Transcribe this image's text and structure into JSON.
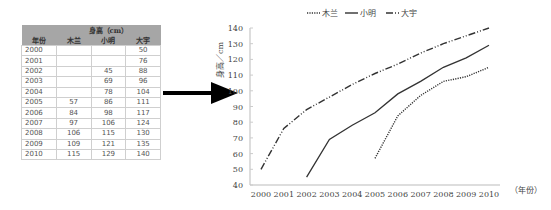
{
  "table": {
    "group_header": "身高（cm）",
    "columns": [
      "年份",
      "木兰",
      "小明",
      "大宇"
    ],
    "rows": [
      [
        "2000",
        "",
        "",
        "50"
      ],
      [
        "2001",
        "",
        "",
        "76"
      ],
      [
        "2002",
        "",
        "45",
        "88"
      ],
      [
        "2003",
        "",
        "69",
        "96"
      ],
      [
        "2004",
        "",
        "78",
        "104"
      ],
      [
        "2005",
        "57",
        "86",
        "111"
      ],
      [
        "2006",
        "84",
        "98",
        "117"
      ],
      [
        "2007",
        "97",
        "106",
        "124"
      ],
      [
        "2008",
        "106",
        "115",
        "130"
      ],
      [
        "2009",
        "109",
        "121",
        "135"
      ],
      [
        "2010",
        "115",
        "129",
        "140"
      ]
    ]
  },
  "chart_data": {
    "type": "line",
    "title": "",
    "xlabel": "（年份）",
    "ylabel": "身高／cm",
    "x": [
      "2000",
      "2001",
      "2002",
      "2003",
      "2004",
      "2005",
      "2006",
      "2007",
      "2008",
      "2009",
      "2010"
    ],
    "ylim": [
      40,
      140
    ],
    "yticks": [
      40,
      50,
      60,
      70,
      80,
      90,
      100,
      110,
      120,
      130,
      140
    ],
    "grid": false,
    "legend_position": "top",
    "series": [
      {
        "name": "木兰",
        "style": "dotted",
        "values": [
          null,
          null,
          null,
          null,
          null,
          57,
          84,
          97,
          106,
          109,
          115
        ]
      },
      {
        "name": "小明",
        "style": "solid",
        "values": [
          null,
          null,
          45,
          69,
          78,
          86,
          98,
          106,
          115,
          121,
          129
        ]
      },
      {
        "name": "大宇",
        "style": "dash-dot",
        "values": [
          50,
          76,
          88,
          96,
          104,
          111,
          117,
          124,
          130,
          135,
          140
        ]
      }
    ]
  },
  "arrow_icon": "right-arrow"
}
